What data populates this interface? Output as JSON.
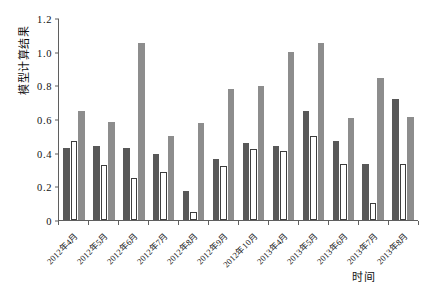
{
  "chart_data": {
    "type": "bar",
    "title": "",
    "xlabel": "时间",
    "ylabel": "模型计算结果",
    "ylim": [
      0,
      1.2
    ],
    "yticks": [
      "0",
      "0.2",
      "0.4",
      "0.6",
      "0.8",
      "1.0",
      "1.2"
    ],
    "ytick_values": [
      0,
      0.2,
      0.4,
      0.6,
      0.8,
      1.0,
      1.2
    ],
    "grid": false,
    "legend": "none",
    "categories": [
      "2012年4月",
      "2012年5月",
      "2012年6月",
      "2012年7月",
      "2012年8月",
      "2012年9月",
      "2012年10月",
      "2013年4月",
      "2013年5月",
      "2013年6月",
      "2013年7月",
      "2013年8月"
    ],
    "series": [
      {
        "name": "series-a",
        "color": "#585858",
        "values": [
          0.43,
          0.44,
          0.425,
          0.39,
          0.175,
          0.36,
          0.46,
          0.44,
          0.65,
          0.47,
          0.33,
          0.72
        ]
      },
      {
        "name": "series-b",
        "color": "#ffffff",
        "values": [
          0.47,
          0.325,
          0.25,
          0.285,
          0.05,
          0.32,
          0.42,
          0.41,
          0.5,
          0.33,
          0.1,
          0.33
        ]
      },
      {
        "name": "series-c",
        "color": "#8d8d8d",
        "values": [
          0.65,
          0.585,
          1.05,
          0.5,
          0.575,
          0.78,
          0.795,
          1.0,
          1.05,
          0.605,
          0.845,
          0.61
        ]
      }
    ]
  }
}
